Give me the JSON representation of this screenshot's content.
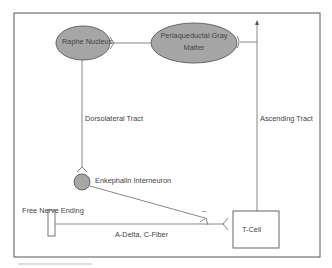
{
  "diagram": {
    "nodes": {
      "raphe_nucleus": "Raphe Nucleus",
      "pag_line1": "Periaqueductal Gray",
      "pag_line2": "Matter",
      "enkephalin": "Enkephalin Interneuron",
      "free_nerve": "Free Nerve Ending",
      "t_cell": "T-Cell"
    },
    "edges": {
      "dorsolateral": "Dorsolateral Tract",
      "ascending": "Ascending Tract",
      "afferent": "A-Delta, C-Fiber",
      "inhibitory_sign": "–"
    },
    "colors": {
      "node_fill": "#a6a6a6",
      "stroke": "#555555",
      "line": "#888888"
    }
  }
}
